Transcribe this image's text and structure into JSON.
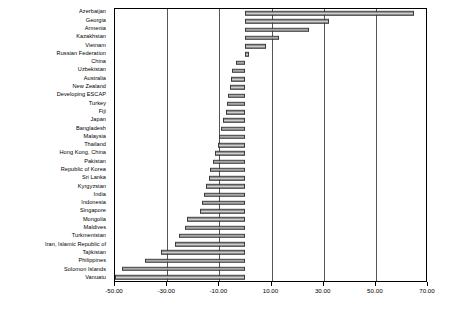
{
  "chart_data": {
    "type": "bar",
    "orientation": "horizontal",
    "title": "",
    "subtitle": "",
    "xlabel": "",
    "ylabel": "",
    "xlim": [
      -50.0,
      70.0
    ],
    "xticks": [
      -50.0,
      -30.0,
      -10.0,
      10.0,
      30.0,
      50.0,
      70.0
    ],
    "xtick_labels": [
      "-50.00",
      "-30.00",
      "-10.00",
      "10.00",
      "30.00",
      "50.00",
      "70.00"
    ],
    "grid": true,
    "grid_axis": "x",
    "legend": false,
    "legend_position": "none",
    "zero_line": 0.0,
    "bar_fill": "#b0b0b0",
    "bar_edge": "#3a3a3a",
    "plot_border": "#000000",
    "gridline_color": "#555555",
    "background": "#ffffff",
    "categories": [
      "Azerbaijan",
      "Georgia",
      "Armenia",
      "Kazakhstan",
      "Vietnam",
      "Russian Federation",
      "China",
      "Uzbekistan",
      "Australia",
      "New Zealand",
      "Developing ESCAP",
      "Turkey",
      "Fiji",
      "Japan",
      "Bangladesh",
      "Malaysia",
      "Thailand",
      "Hong Kong, China",
      "Pakistan",
      "Republic of Korea",
      "Sri Lanka",
      "Kyrgyzstan",
      "India",
      "Indonesia",
      "Singapore",
      "Mongolia",
      "Maldives",
      "Turkmenistan",
      "Iran, Islamic Republic of",
      "Tajikistan",
      "Philippines",
      "Solomon Islands",
      "Vanuatu"
    ],
    "values": [
      64.5,
      32.0,
      24.5,
      13.0,
      8.0,
      1.5,
      -3.5,
      -5.0,
      -5.5,
      -6.0,
      -6.5,
      -7.0,
      -7.5,
      -8.5,
      -9.5,
      -10.0,
      -10.5,
      -11.5,
      -12.5,
      -13.5,
      -14.0,
      -15.0,
      -16.0,
      -16.5,
      -17.5,
      -22.5,
      -23.0,
      -25.5,
      -27.0,
      -32.5,
      -38.5,
      -47.5,
      -50.0
    ]
  }
}
